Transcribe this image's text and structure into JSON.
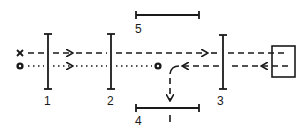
{
  "diagram": {
    "stroke_color": "#1a1a1a",
    "background": "#ffffff",
    "elements": [
      {
        "id": "1",
        "label": "1",
        "kind": "vertical-plate"
      },
      {
        "id": "2",
        "label": "2",
        "kind": "vertical-plate"
      },
      {
        "id": "3",
        "label": "3",
        "kind": "vertical-plate"
      },
      {
        "id": "4",
        "label": "4",
        "kind": "horizontal-screen"
      },
      {
        "id": "5",
        "label": "5",
        "kind": "horizontal-screen"
      }
    ],
    "source_box": {
      "kind": "square"
    },
    "markers": {
      "cross": "x",
      "dot": "circled-dot"
    },
    "beams": [
      {
        "name": "dashed-forward",
        "style": "dashed",
        "direction": "right"
      },
      {
        "name": "dotted-forward",
        "style": "dotted",
        "direction": "right"
      },
      {
        "name": "dashed-return",
        "style": "dashed",
        "direction": "left"
      },
      {
        "name": "deflected",
        "style": "dashed",
        "direction": "down"
      }
    ],
    "screen4_tick_label": "I"
  }
}
